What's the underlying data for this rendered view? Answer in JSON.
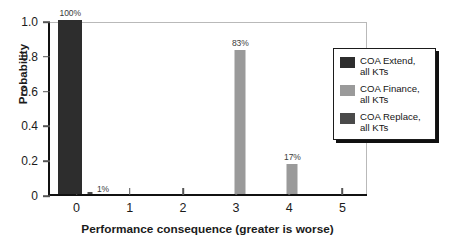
{
  "chart_data": {
    "type": "bar",
    "title": "",
    "xlabel": "Performance consequence (greater is worse)",
    "ylabel": "Probability",
    "xlim": [
      -0.5,
      5.5
    ],
    "ylim": [
      0,
      1.0
    ],
    "xticks": [
      "0",
      "1",
      "2",
      "3",
      "4",
      "5"
    ],
    "xtick_values": [
      0,
      1,
      2,
      3,
      4,
      5
    ],
    "yticks": [
      "0",
      "0.2",
      "0.4",
      "0.6",
      "0.8",
      "1.0"
    ],
    "ytick_values": [
      0,
      0.2,
      0.4,
      0.6,
      0.8,
      1.0
    ],
    "grid": false,
    "legend_position": "right",
    "bars": [
      {
        "x": -0.12,
        "value": 1.0,
        "label": "100%",
        "series": "COA Extend, all KTs",
        "color": "#2d2d2d",
        "width_px": 24,
        "label_pos": "above"
      },
      {
        "x": 0.26,
        "value": 0.01,
        "label": "1%",
        "series": "COA Replace, all KTs",
        "color": "#4a4a4a",
        "width_px": 5,
        "label_pos": "right"
      },
      {
        "x": 3.08,
        "value": 0.83,
        "label": "83%",
        "series": "COA Finance, all KTs",
        "color": "#9a9a9a",
        "width_px": 11,
        "label_pos": "above"
      },
      {
        "x": 4.06,
        "value": 0.17,
        "label": "17%",
        "series": "COA Finance, all KTs",
        "color": "#9a9a9a",
        "width_px": 11,
        "label_pos": "above"
      }
    ],
    "series": [
      {
        "name": "COA Extend, all KTs",
        "color": "#2d2d2d",
        "categories": [
          0
        ],
        "values": [
          1.0
        ]
      },
      {
        "name": "COA Finance, all KTs",
        "color": "#9a9a9a",
        "categories": [
          3,
          4
        ],
        "values": [
          0.83,
          0.17
        ]
      },
      {
        "name": "COA Replace, all KTs",
        "color": "#4a4a4a",
        "categories": [
          0
        ],
        "values": [
          0.01
        ]
      }
    ]
  },
  "legend": {
    "items": [
      {
        "line1": "COA Extend,",
        "line2": "all KTs",
        "color": "#2d2d2d"
      },
      {
        "line1": "COA Finance,",
        "line2": "all KTs",
        "color": "#9a9a9a"
      },
      {
        "line1": "COA Replace,",
        "line2": "all KTs",
        "color": "#4a4a4a"
      }
    ]
  }
}
